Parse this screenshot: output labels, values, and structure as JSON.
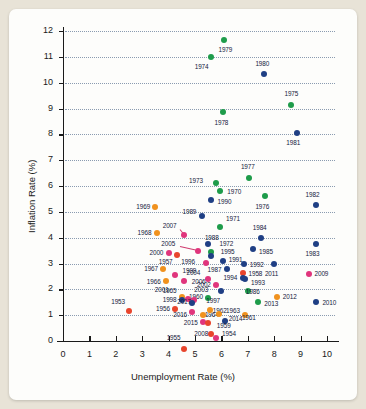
{
  "chart_data": {
    "type": "scatter",
    "title": "",
    "xlabel": "Unemployment Rate (%)",
    "ylabel": "Inflation Rate (%)",
    "xlim": [
      0,
      10.6
    ],
    "ylim": [
      0,
      12.4
    ],
    "xticks": [
      "0",
      "1",
      "2",
      "3",
      "4",
      "5",
      "6",
      "7",
      "8",
      "9",
      "10"
    ],
    "yticks": [
      "0",
      "1",
      "2",
      "3",
      "4",
      "5",
      "6",
      "7",
      "8",
      "9",
      "10",
      "11",
      "12"
    ],
    "grid": true,
    "grid_style": "dotted-horizontal",
    "legend": "none",
    "colors": {
      "green": "#1e9c4a",
      "blue": "#1f3f84",
      "orange": "#f0921e",
      "red": "#e8452c",
      "pink": "#e0357c"
    },
    "points": [
      {
        "label": "1979",
        "x": 6.1,
        "y": 11.65,
        "color": "green",
        "lx": 6.15,
        "ly": 11.25,
        "anchor": "center"
      },
      {
        "label": "1974",
        "x": 5.6,
        "y": 11.0,
        "color": "green",
        "lx": 5.25,
        "ly": 10.62,
        "anchor": "center"
      },
      {
        "label": "1980",
        "x": 7.6,
        "y": 10.33,
        "color": "blue",
        "lx": 7.55,
        "ly": 10.72,
        "anchor": "center"
      },
      {
        "label": "1975",
        "x": 8.65,
        "y": 9.15,
        "color": "green",
        "lx": 8.65,
        "ly": 9.55,
        "anchor": "center"
      },
      {
        "label": "1978",
        "x": 6.05,
        "y": 8.85,
        "color": "green",
        "lx": 6.0,
        "ly": 8.45,
        "anchor": "center"
      },
      {
        "label": "1981",
        "x": 8.85,
        "y": 8.05,
        "color": "blue",
        "lx": 8.72,
        "ly": 7.65,
        "anchor": "center"
      },
      {
        "label": "1977",
        "x": 7.05,
        "y": 6.3,
        "color": "green",
        "lx": 7.0,
        "ly": 6.72,
        "anchor": "center"
      },
      {
        "label": "1973",
        "x": 5.8,
        "y": 6.1,
        "color": "green",
        "lx": 5.3,
        "ly": 6.2,
        "anchor": "right"
      },
      {
        "label": "1970",
        "x": 5.95,
        "y": 5.82,
        "color": "green",
        "lx": 6.15,
        "ly": 5.78,
        "anchor": "left"
      },
      {
        "label": "1976",
        "x": 7.65,
        "y": 5.6,
        "color": "green",
        "lx": 7.55,
        "ly": 5.2,
        "anchor": "center"
      },
      {
        "label": "1990",
        "x": 5.6,
        "y": 5.45,
        "color": "blue",
        "lx": 5.78,
        "ly": 5.4,
        "anchor": "left"
      },
      {
        "label": "1982",
        "x": 9.6,
        "y": 5.25,
        "color": "blue",
        "lx": 9.45,
        "ly": 5.65,
        "anchor": "center"
      },
      {
        "label": "1969",
        "x": 3.5,
        "y": 5.2,
        "color": "orange",
        "lx": 3.3,
        "ly": 5.2,
        "anchor": "right"
      },
      {
        "label": "1989",
        "x": 5.25,
        "y": 4.85,
        "color": "blue",
        "lx": 5.05,
        "ly": 5.0,
        "anchor": "right"
      },
      {
        "label": "1971",
        "x": 5.95,
        "y": 4.4,
        "color": "green",
        "lx": 6.1,
        "ly": 4.72,
        "anchor": "left"
      },
      {
        "label": "1968",
        "x": 3.55,
        "y": 4.18,
        "color": "orange",
        "lx": 3.35,
        "ly": 4.18,
        "anchor": "right"
      },
      {
        "label": "2007",
        "x": 4.6,
        "y": 4.1,
        "color": "pink",
        "lx": 4.3,
        "ly": 4.45,
        "anchor": "right"
      },
      {
        "label": "1984",
        "x": 7.5,
        "y": 4.0,
        "color": "blue",
        "lx": 7.45,
        "ly": 4.38,
        "anchor": "center"
      },
      {
        "label": "1988",
        "x": 5.5,
        "y": 3.75,
        "color": "blue",
        "lx": 5.3,
        "ly": 3.98,
        "anchor": "left"
      },
      {
        "label": "1983",
        "x": 9.6,
        "y": 3.75,
        "color": "blue",
        "lx": 9.45,
        "ly": 3.38,
        "anchor": "center"
      },
      {
        "label": "1985",
        "x": 7.2,
        "y": 3.55,
        "color": "blue",
        "lx": 7.35,
        "ly": 3.45,
        "anchor": "left"
      },
      {
        "label": "2005",
        "x": 5.1,
        "y": 3.5,
        "color": "pink",
        "lx": 4.25,
        "ly": 3.75,
        "anchor": "right"
      },
      {
        "label": "1972",
        "x": 5.6,
        "y": 3.45,
        "color": "green",
        "lx": 5.85,
        "ly": 3.75,
        "anchor": "left"
      },
      {
        "label": "2000",
        "x": 4.0,
        "y": 3.4,
        "color": "pink",
        "lx": 3.8,
        "ly": 3.42,
        "anchor": "right"
      },
      {
        "label": "1995",
        "x": 5.6,
        "y": 3.3,
        "color": "blue",
        "lx": 5.9,
        "ly": 3.45,
        "anchor": "left"
      },
      {
        "label": "1957",
        "x": 4.3,
        "y": 3.32,
        "color": "red",
        "lx": 4.15,
        "ly": 3.06,
        "anchor": "right"
      },
      {
        "label": "1996",
        "x": 5.4,
        "y": 3.02,
        "color": "pink",
        "lx": 5.0,
        "ly": 3.06,
        "anchor": "right"
      },
      {
        "label": "1991",
        "x": 6.05,
        "y": 3.08,
        "color": "blue",
        "lx": 6.2,
        "ly": 3.12,
        "anchor": "left"
      },
      {
        "label": "1992",
        "x": 6.85,
        "y": 3.0,
        "color": "blue",
        "lx": 7.0,
        "ly": 2.96,
        "anchor": "left"
      },
      {
        "label": "2011",
        "x": 8.0,
        "y": 3.0,
        "color": "blue",
        "lx": 7.9,
        "ly": 2.6,
        "anchor": "center"
      },
      {
        "label": "1987",
        "x": 6.2,
        "y": 2.78,
        "color": "blue",
        "lx": 6.0,
        "ly": 2.76,
        "anchor": "right"
      },
      {
        "label": "1967",
        "x": 3.8,
        "y": 2.78,
        "color": "orange",
        "lx": 3.6,
        "ly": 2.78,
        "anchor": "right"
      },
      {
        "label": "1999",
        "x": 4.25,
        "y": 2.55,
        "color": "pink",
        "lx": 4.45,
        "ly": 2.7,
        "anchor": "left"
      },
      {
        "label": "1958",
        "x": 6.8,
        "y": 2.62,
        "color": "red",
        "lx": 6.95,
        "ly": 2.6,
        "anchor": "left"
      },
      {
        "label": "2009",
        "x": 9.3,
        "y": 2.6,
        "color": "pink",
        "lx": 9.45,
        "ly": 2.58,
        "anchor": "left"
      },
      {
        "label": "2004",
        "x": 5.5,
        "y": 2.4,
        "color": "pink",
        "lx": 5.2,
        "ly": 2.64,
        "anchor": "right"
      },
      {
        "label": "1994",
        "x": 6.8,
        "y": 2.42,
        "color": "blue",
        "lx": 6.6,
        "ly": 2.44,
        "anchor": "right"
      },
      {
        "label": "1993",
        "x": 6.9,
        "y": 2.4,
        "color": "blue",
        "lx": 7.05,
        "ly": 2.26,
        "anchor": "left"
      },
      {
        "label": "1966",
        "x": 3.9,
        "y": 2.32,
        "color": "orange",
        "lx": 3.7,
        "ly": 2.3,
        "anchor": "right"
      },
      {
        "label": "2006",
        "x": 4.6,
        "y": 2.32,
        "color": "pink",
        "lx": 4.8,
        "ly": 2.3,
        "anchor": "left"
      },
      {
        "label": "2002",
        "x": 5.8,
        "y": 2.18,
        "color": "pink",
        "lx": 5.6,
        "ly": 2.16,
        "anchor": "right"
      },
      {
        "label": "1986",
        "x": 7.0,
        "y": 1.92,
        "color": "green",
        "lx": 6.85,
        "ly": 1.9,
        "anchor": "left"
      },
      {
        "label": "2003",
        "x": 6.0,
        "y": 1.92,
        "color": "blue",
        "lx": 5.5,
        "ly": 1.98,
        "anchor": "right"
      },
      {
        "label": "1965",
        "x": 4.5,
        "y": 1.7,
        "color": "orange",
        "lx": 4.3,
        "ly": 1.92,
        "anchor": "right"
      },
      {
        "label": "1960",
        "x": 5.5,
        "y": 1.68,
        "color": "green",
        "lx": 5.3,
        "ly": 1.72,
        "anchor": "right"
      },
      {
        "label": "2012",
        "x": 8.1,
        "y": 1.72,
        "color": "orange",
        "lx": 8.25,
        "ly": 1.7,
        "anchor": "left"
      },
      {
        "label": "2001",
        "x": 4.75,
        "y": 1.62,
        "color": "pink",
        "lx": 4.0,
        "ly": 1.98,
        "anchor": "right"
      },
      {
        "label": "1998",
        "x": 4.5,
        "y": 1.58,
        "color": "blue",
        "lx": 4.3,
        "ly": 1.6,
        "anchor": "right"
      },
      {
        "label": "1997",
        "x": 4.95,
        "y": 1.6,
        "color": "pink",
        "lx": 5.35,
        "ly": 1.55,
        "anchor": "left"
      },
      {
        "label": "2017",
        "x": 4.9,
        "y": 1.48,
        "color": "blue",
        "lx": 4.85,
        "ly": 1.52,
        "anchor": "right"
      },
      {
        "label": "2013",
        "x": 7.4,
        "y": 1.5,
        "color": "green",
        "lx": 7.55,
        "ly": 1.45,
        "anchor": "left"
      },
      {
        "label": "1953",
        "x": 2.5,
        "y": 1.15,
        "color": "red",
        "lx": 2.35,
        "ly": 1.5,
        "anchor": "right"
      },
      {
        "label": "1956",
        "x": 4.25,
        "y": 1.22,
        "color": "red",
        "lx": 4.05,
        "ly": 1.22,
        "anchor": "right"
      },
      {
        "label": "2016",
        "x": 4.9,
        "y": 1.12,
        "color": "pink",
        "lx": 4.7,
        "ly": 1.0,
        "anchor": "right"
      },
      {
        "label": "1964",
        "x": 5.3,
        "y": 1.0,
        "color": "orange",
        "lx": 5.3,
        "ly": 1.0,
        "anchor": "left"
      },
      {
        "label": "1962",
        "x": 5.55,
        "y": 1.2,
        "color": "orange",
        "lx": 5.6,
        "ly": 1.18,
        "anchor": "left"
      },
      {
        "label": "1963",
        "x": 5.9,
        "y": 1.05,
        "color": "orange",
        "lx": 6.1,
        "ly": 1.18,
        "anchor": "left"
      },
      {
        "label": "1961",
        "x": 6.9,
        "y": 1.02,
        "color": "orange",
        "lx": 6.7,
        "ly": 0.9,
        "anchor": "left"
      },
      {
        "label": "2010",
        "x": 9.6,
        "y": 1.5,
        "color": "blue",
        "lx": 9.75,
        "ly": 1.48,
        "anchor": "left"
      },
      {
        "label": "2014",
        "x": 6.15,
        "y": 0.78,
        "color": "blue",
        "lx": 6.2,
        "ly": 0.85,
        "anchor": "left"
      },
      {
        "label": "2015",
        "x": 5.3,
        "y": 0.72,
        "color": "pink",
        "lx": 5.1,
        "ly": 0.7,
        "anchor": "right"
      },
      {
        "label": "1959",
        "x": 5.5,
        "y": 0.68,
        "color": "red",
        "lx": 5.75,
        "ly": 0.6,
        "anchor": "left"
      },
      {
        "label": "2008",
        "x": 5.8,
        "y": 0.1,
        "color": "pink",
        "lx": 5.5,
        "ly": 0.28,
        "anchor": "right"
      },
      {
        "label": "1954",
        "x": 5.6,
        "y": 0.28,
        "color": "red",
        "lx": 5.95,
        "ly": 0.28,
        "anchor": "left"
      },
      {
        "label": "1955",
        "x": 4.6,
        "y": -0.32,
        "color": "red",
        "lx": 4.45,
        "ly": 0.1,
        "anchor": "right"
      }
    ],
    "leaders": [
      {
        "x1": 4.42,
        "y1": 4.33,
        "x2": 4.58,
        "y2": 4.12
      },
      {
        "x1": 4.45,
        "y1": 3.66,
        "x2": 5.05,
        "y2": 3.52
      }
    ]
  }
}
